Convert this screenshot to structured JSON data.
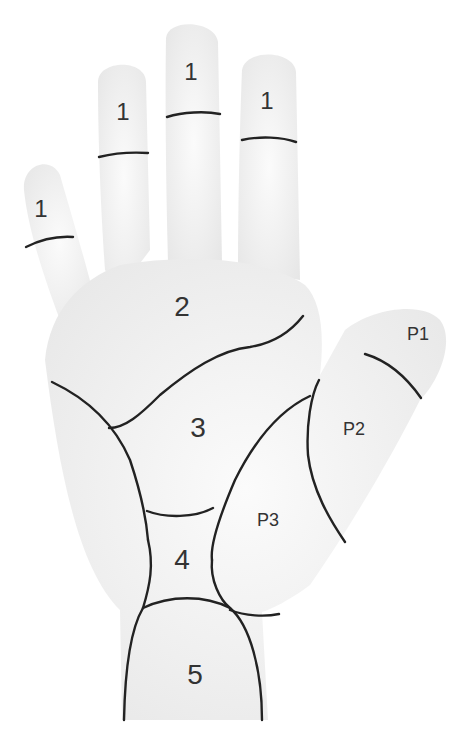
{
  "diagram": {
    "line_color": "#222222",
    "skin_color": "#f0f0f0",
    "labels": {
      "finger_little": "1",
      "finger_ring": "1",
      "finger_middle": "1",
      "finger_index": "1",
      "region_2": "2",
      "region_3": "3",
      "region_4": "4",
      "region_5": "5",
      "thumb_p1": "P1",
      "thumb_p2": "P2",
      "thumb_p3": "P3"
    }
  }
}
